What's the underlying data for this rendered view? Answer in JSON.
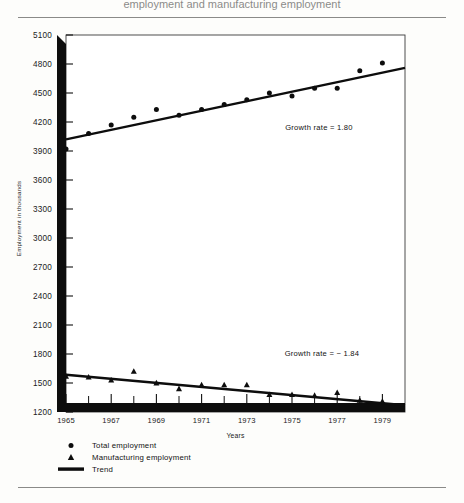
{
  "figure": {
    "clipped_header_text": "employment and manufacturing employment",
    "ylabel": "Employment in thousands",
    "xlabel": "Years"
  },
  "annotations": {
    "total_growth": "Growth rate  =  1.80",
    "manufacturing_growth": "Growth rate  =  − 1.84"
  },
  "legend": {
    "items": [
      {
        "marker": "circle-marker",
        "label": "Total employment"
      },
      {
        "marker": "triangle-marker",
        "label": "Manufacturing employment"
      },
      {
        "marker": "line-marker",
        "label": "Trend"
      }
    ]
  },
  "chart_data": {
    "type": "scatter",
    "title": "",
    "xlabel": "Years",
    "ylabel": "Employment in thousands",
    "xlim": [
      1965,
      1980
    ],
    "ylim": [
      1200,
      5100
    ],
    "yticks": [
      1200,
      1500,
      1800,
      2100,
      2400,
      2700,
      3000,
      3300,
      3600,
      3900,
      4200,
      4500,
      4800,
      5100
    ],
    "xticks": [
      1965,
      1967,
      1969,
      1971,
      1973,
      1975,
      1977,
      1979
    ],
    "xticks_minor": [
      1966,
      1968,
      1970,
      1972,
      1974,
      1976,
      1978
    ],
    "grid": false,
    "legend_position": "below-axes-left",
    "x": [
      1965,
      1966,
      1967,
      1968,
      1969,
      1970,
      1971,
      1972,
      1973,
      1974,
      1975,
      1976,
      1977,
      1978,
      1979
    ],
    "series": [
      {
        "name": "Total employment",
        "marker": "circle",
        "values": [
          3920,
          4080,
          4170,
          4250,
          4330,
          4270,
          4330,
          4380,
          4430,
          4500,
          4470,
          4550,
          4550,
          4730,
          4810
        ]
      },
      {
        "name": "Manufacturing employment",
        "marker": "triangle",
        "values": [
          1570,
          1560,
          1530,
          1620,
          1500,
          1440,
          1480,
          1480,
          1480,
          1380,
          1380,
          1370,
          1400,
          1320,
          1310
        ]
      }
    ],
    "trends": [
      {
        "name": "Total employment trend",
        "growth_rate": 1.8,
        "x": [
          1965,
          1980
        ],
        "y": [
          4020,
          4760
        ]
      },
      {
        "name": "Manufacturing employment trend",
        "growth_rate": -1.84,
        "x": [
          1965,
          1980
        ],
        "y": [
          1585,
          1270
        ]
      }
    ]
  }
}
